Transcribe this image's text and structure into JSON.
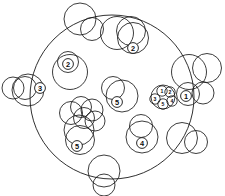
{
  "figure": {
    "type": "diagram",
    "background_color": "#ffffff",
    "stroke_color": "#1a1a1a",
    "width": 225,
    "height": 196,
    "boundary": {
      "name": "large enclosing circle",
      "cx": 112,
      "cy": 97,
      "r": 82,
      "stroke_width": 0.9
    },
    "circles": [
      {
        "cx": 80,
        "cy": 19,
        "r": 16,
        "sw": 0.85
      },
      {
        "cx": 92,
        "cy": 29,
        "r": 11.5,
        "sw": 0.85
      },
      {
        "cx": 117,
        "cy": 33,
        "r": 16.5,
        "sw": 0.85
      },
      {
        "cx": 131,
        "cy": 31,
        "r": 14.5,
        "sw": 0.85
      },
      {
        "cx": 133,
        "cy": 38,
        "r": 15.5,
        "sw": 0.85
      },
      {
        "cx": 68,
        "cy": 62,
        "r": 10.5,
        "sw": 0.85
      },
      {
        "cx": 70,
        "cy": 72,
        "r": 17.5,
        "sw": 0.85
      },
      {
        "cx": 13,
        "cy": 88,
        "r": 11,
        "sw": 0.85
      },
      {
        "cx": 25,
        "cy": 88,
        "r": 11.5,
        "sw": 0.85
      },
      {
        "cx": 28,
        "cy": 90,
        "r": 16,
        "sw": 0.85
      },
      {
        "cx": 113,
        "cy": 88,
        "r": 11.5,
        "sw": 0.85
      },
      {
        "cx": 122,
        "cy": 96,
        "r": 16,
        "sw": 0.85
      },
      {
        "cx": 189,
        "cy": 72,
        "r": 17.5,
        "sw": 0.85
      },
      {
        "cx": 207,
        "cy": 68,
        "r": 14.5,
        "sw": 0.85
      },
      {
        "cx": 188,
        "cy": 94,
        "r": 11.5,
        "sw": 0.85
      },
      {
        "cx": 203,
        "cy": 93,
        "r": 11,
        "sw": 0.85
      },
      {
        "cx": 71,
        "cy": 113,
        "r": 11.5,
        "sw": 0.85
      },
      {
        "cx": 81,
        "cy": 107,
        "r": 10.5,
        "sw": 0.85
      },
      {
        "cx": 92,
        "cy": 110,
        "r": 11,
        "sw": 0.85
      },
      {
        "cx": 84,
        "cy": 118,
        "r": 10.5,
        "sw": 0.85
      },
      {
        "cx": 95,
        "cy": 121,
        "r": 10,
        "sw": 0.85
      },
      {
        "cx": 79,
        "cy": 130,
        "r": 15,
        "sw": 0.85
      },
      {
        "cx": 80,
        "cy": 140,
        "r": 14.5,
        "sw": 0.85
      },
      {
        "cx": 141,
        "cy": 126,
        "r": 11.5,
        "sw": 0.85
      },
      {
        "cx": 142,
        "cy": 137,
        "r": 16,
        "sw": 0.85
      },
      {
        "cx": 182,
        "cy": 138,
        "r": 15.5,
        "sw": 0.85
      },
      {
        "cx": 196,
        "cy": 142,
        "r": 11.5,
        "sw": 0.85
      },
      {
        "cx": 104,
        "cy": 171,
        "r": 16,
        "sw": 0.85
      },
      {
        "cx": 104,
        "cy": 185,
        "r": 11,
        "sw": 0.85
      }
    ],
    "markers": [
      {
        "label": "1",
        "cx": 186,
        "cy": 96,
        "r": 5.4
      },
      {
        "label": "2",
        "cx": 133,
        "cy": 48,
        "r": 5.4
      },
      {
        "label": "2",
        "cx": 68,
        "cy": 64,
        "r": 5.4
      },
      {
        "label": "3",
        "cx": 40,
        "cy": 88,
        "r": 5.4
      },
      {
        "label": "5",
        "cx": 117,
        "cy": 102,
        "r": 5.4
      },
      {
        "label": "5",
        "cx": 77,
        "cy": 146,
        "r": 5.4
      },
      {
        "label": "4",
        "cx": 142,
        "cy": 143,
        "r": 5.4
      }
    ],
    "micro_cluster": {
      "name": "dense micro cluster",
      "cx": 163,
      "cy": 97,
      "r": 12,
      "ring_r": 5.2,
      "members": [
        {
          "label": "1",
          "cx": 162,
          "cy": 91
        },
        {
          "label": "2",
          "cx": 170,
          "cy": 92
        },
        {
          "label": "3",
          "cx": 155,
          "cy": 99
        },
        {
          "label": "4",
          "cx": 172,
          "cy": 101
        },
        {
          "label": "5",
          "cx": 163,
          "cy": 104
        }
      ]
    },
    "marker_labels_summary": "1, 2, 2, 3, 4, 5, 5 plus micro cluster 1-5"
  }
}
